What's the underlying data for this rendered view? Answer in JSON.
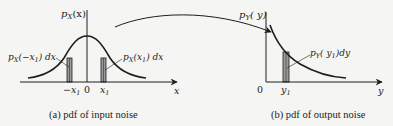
{
  "panel_a": {
    "y_label": "p",
    "y_label_sub": "X",
    "y_label_arg": "(x)",
    "left_area_label": "p",
    "left_area_sub": "X",
    "left_area_arg": "(−x",
    "left_area_arg_sub": "1",
    "left_area_tail": ") dx",
    "right_area_label": "p",
    "right_area_sub": "X",
    "right_area_arg": "(x",
    "right_area_arg_sub": "1",
    "right_area_tail": ") dx",
    "tick_neg": "−x",
    "tick_neg_sub": "1",
    "tick_zero": "0",
    "tick_pos": "x",
    "tick_pos_sub": "1",
    "x_axis_label": "x",
    "caption": "(a) pdf of input noise"
  },
  "panel_b": {
    "y_label": "p",
    "y_label_sub": "Y",
    "y_label_arg": "( y)",
    "area_label": "p",
    "area_sub": "Y",
    "area_arg": "( y",
    "area_arg_sub": "1",
    "area_tail": ")dy",
    "origin": "0",
    "tick": "y",
    "tick_sub": "1",
    "x_axis_label": "y",
    "caption": "(b) pdf of output noise"
  },
  "colors": {
    "ink": "#1e1e1e",
    "shade": "#9a9a9a",
    "background": "#f5f5f3"
  }
}
